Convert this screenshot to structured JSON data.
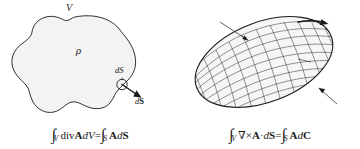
{
  "figure": {
    "background_color": "#ffffff",
    "ink_color": "#1a1a1a",
    "blob_fill_color": "#f2f2f2",
    "panels": [
      {
        "id": "divergence-theorem",
        "shape": "irregular-blob",
        "labels": {
          "volume": "V",
          "density": "ρ",
          "surface_element_scalar_d": "d",
          "surface_element_scalar_S": "S",
          "surface_element_vector_d": "d",
          "surface_element_vector_S": "S"
        },
        "equation": {
          "integral_symbol": "∫",
          "left_subscript": "V",
          "left_operator": "div",
          "left_field": "A",
          "left_differential_d": "d",
          "left_differential_V": "V",
          "equals": "=",
          "right_subscript": "S",
          "right_field": "A",
          "right_differential_d": "d",
          "right_differential_S": "S",
          "plain_text": "∫_V div A dV = ∫_S A dS"
        }
      },
      {
        "id": "stokes-theorem",
        "shape": "meshed-ellipse",
        "labels": {
          "surface": "S",
          "contour": "C",
          "line_element_d": "d",
          "line_element_C": "C",
          "surface_element_d": "d",
          "surface_element_S": "S"
        },
        "equation": {
          "integral_symbol": "∫",
          "left_subscript": "V",
          "nabla": "∇",
          "cross": "×",
          "left_field": "A",
          "dot": "·",
          "left_differential_d": "d",
          "left_differential_S": "S",
          "equals": "=",
          "right_subscript": "S",
          "right_field": "A",
          "right_differential_d": "d",
          "right_differential_C": "C",
          "plain_text": "∫_V ∇×A · dS = ∫_S A dC"
        }
      }
    ]
  }
}
